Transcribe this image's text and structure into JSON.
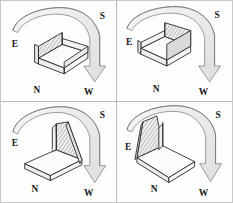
{
  "figure": {
    "layout": {
      "rows": 2,
      "columns": 2,
      "panel_count": 4
    },
    "colors": {
      "background": "#fdfdfd",
      "outer_border": "#c9c9c9",
      "divider": "#b9b9b9",
      "line": "#2b2b2b",
      "label": "#1a1a1a",
      "arrow_fill": "#ededed",
      "arrow_stroke": "#8a8a8a",
      "box_face_light": "#ffffff",
      "box_face_mid": "#f4f4f4",
      "box_face_dark": "#e8e8e8",
      "hatch_shade": "#9a9a9a"
    }
  },
  "compass": {
    "labels": [
      "E",
      "S",
      "N",
      "W"
    ],
    "east": "E",
    "south": "S",
    "north": "N",
    "west": "W"
  },
  "panels": [
    {
      "index": 1,
      "name": "panel-top-left",
      "shaded_wall": "front-left",
      "rotation_step": "0",
      "labels": {
        "east": "E",
        "south": "S",
        "north": "N",
        "west": "W"
      },
      "arrow": {
        "from": "E",
        "to": "W",
        "direction": "clockwise-over-top"
      }
    },
    {
      "index": 2,
      "name": "panel-top-right",
      "shaded_wall": "front-right",
      "rotation_step": "1",
      "labels": {
        "east": "E",
        "south": "S",
        "north": "N",
        "west": "W"
      },
      "arrow": {
        "from": "E",
        "to": "W",
        "direction": "clockwise-over-top"
      }
    },
    {
      "index": 3,
      "name": "panel-bottom-left",
      "shaded_wall": "back-right",
      "rotation_step": "2",
      "labels": {
        "east": "E",
        "south": "S",
        "north": "N",
        "west": "W"
      },
      "arrow": {
        "from": "E",
        "to": "W",
        "direction": "clockwise-over-top"
      }
    },
    {
      "index": 4,
      "name": "panel-bottom-right",
      "shaded_wall": "back-left",
      "rotation_step": "3",
      "labels": {
        "east": "E",
        "south": "S",
        "north": "N",
        "west": "W"
      },
      "arrow": {
        "from": "E",
        "to": "W",
        "direction": "clockwise-over-top"
      }
    }
  ]
}
